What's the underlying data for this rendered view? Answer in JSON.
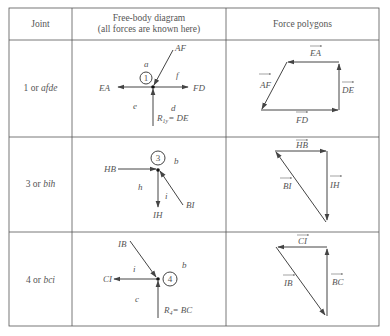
{
  "table": {
    "headers": {
      "joint": "Joint",
      "fbd_line1": "Free-body diagram",
      "fbd_line2": "(all forces are known here)",
      "polygons": "Force polygons"
    },
    "rows": [
      {
        "joint_num": "1 or ",
        "joint_letters": "afde",
        "fbd": {
          "circle": "1",
          "labels": {
            "a": "a",
            "f": "f",
            "e": "e",
            "d": "d",
            "AF": "AF",
            "EA": "EA",
            "FD": "FD",
            "R": "R",
            "Rsub": "1y",
            "Req": "= DE"
          }
        },
        "polygon": {
          "labels": [
            "EA",
            "AF",
            "DE",
            "FD"
          ]
        }
      },
      {
        "joint_num": "3 or ",
        "joint_letters": "bih",
        "fbd": {
          "circle": "3",
          "labels": {
            "b": "b",
            "h": "h",
            "i": "i",
            "HB": "HB",
            "IH": "IH",
            "BI": "BI"
          }
        },
        "polygon": {
          "labels": [
            "HB",
            "BI",
            "IH"
          ]
        }
      },
      {
        "joint_num": "4 or ",
        "joint_letters": "bci",
        "fbd": {
          "circle": "4",
          "labels": {
            "b": "b",
            "i": "i",
            "c": "c",
            "IB": "IB",
            "CI": "CI",
            "R": "R",
            "Rsub": "4",
            "Req": "= BC"
          }
        },
        "polygon": {
          "labels": [
            "CI",
            "IB",
            "BC"
          ]
        }
      }
    ]
  },
  "colors": {
    "line": "#444444",
    "text": "#555555"
  }
}
